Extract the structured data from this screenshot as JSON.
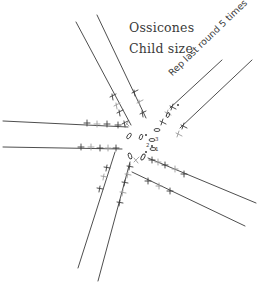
{
  "title": {
    "line1": "Ossicones",
    "line2": "Child size"
  },
  "annotation": "Rep last round 5 times",
  "round_labels": [
    "1",
    "2",
    "3"
  ],
  "colors": {
    "ink": "#3a3a3a",
    "light_ink": "#9a9a9a",
    "background": "#ffffff"
  },
  "arms": [
    {
      "name": "top-left",
      "count": 2
    },
    {
      "name": "top-right",
      "count": 2
    },
    {
      "name": "left",
      "count": 2
    },
    {
      "name": "right",
      "count": 2
    },
    {
      "name": "bottom",
      "count": 2
    }
  ]
}
